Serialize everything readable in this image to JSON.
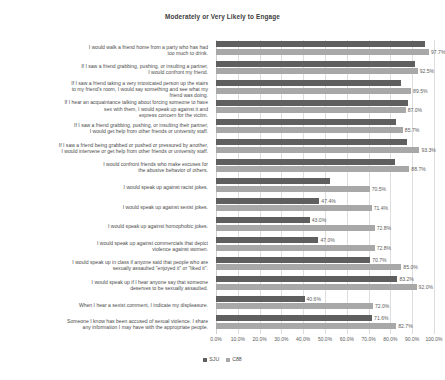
{
  "chart_data": {
    "type": "bar",
    "orientation": "horizontal",
    "title": "Moderately or Very Likely to Engage",
    "xlabel": "",
    "ylabel": "",
    "xlim": [
      0,
      100
    ],
    "grid": true,
    "legend_position": "bottom",
    "tick_labels": [
      "0.0%",
      "10.0%",
      "20.0%",
      "30.0%",
      "40.0%",
      "50.0%",
      "60.0%",
      "70.0%",
      "80.0%",
      "90.0%",
      "100.0%"
    ],
    "tick_values": [
      0,
      10,
      20,
      30,
      40,
      50,
      60,
      70,
      80,
      90,
      100
    ],
    "categories": [
      "I would walk a friend home from a party who has had\ntoo much to drink.",
      "If I saw a friend grabbing, pushing, or insulting a partner,\nI would confront my friend.",
      "If I saw a friend taking a very intoxicated person up the stairs\nto my friend's room, I would say something and see what my\nfriend was doing.",
      "If I hear an acquaintance talking about forcing someone to have\nsex with them, I would speak up against it and\nexpress concern for the victim.",
      "If I saw a friend grabbing, pushing, or insulting their partner,\nI would get help from other friends or university staff.",
      "If I saw a friend being grabbed or pushed or pressured by another,\nI would intervene or get help from other friends or university staff.",
      "I would confront friends who make excuses for\nthe abusive behavior of others.",
      "I would speak up against racist jokes.",
      "I would speak up against sexist jokes.",
      "I would speak up against homophobic jokes.",
      "I would speak up against commercials that depict\nviolence against women.",
      "I would speak up in class if anyone said that people who are\nsexually assaulted \"enjoyed it\" or \"liked it\".",
      "I would speak up if I hear anyone say that someone\ndeserves to be sexually assaulted.",
      "When I hear a sexist comment, I indicate my displeasure.",
      "Someone I know has been accused of sexual violence. I share\nany information I may have with the appropriate people."
    ],
    "series": [
      {
        "name": "SJU",
        "color": "#5f5f5f",
        "values": [
          96.0,
          91.2,
          85.0,
          88.0,
          82.5,
          87.5,
          82.0,
          52.5,
          47.4,
          43.0,
          47.0,
          70.7,
          83.2,
          40.6,
          71.6
        ],
        "labels": [
          "",
          "",
          "",
          "",
          "",
          "",
          "",
          "",
          "47.4%",
          "43.0%",
          "47.0%",
          "70.7%",
          "83.2%",
          "40.6%",
          "71.6%"
        ]
      },
      {
        "name": "C88",
        "color": "#a8a8a8",
        "values": [
          97.7,
          92.5,
          89.5,
          87.0,
          85.7,
          93.3,
          88.7,
          70.5,
          71.4,
          72.8,
          72.8,
          85.0,
          92.0,
          72.0,
          82.7
        ],
        "labels": [
          "97.7%",
          "92.5%",
          "89.5%",
          "87.0%",
          "85.7%",
          "93.3%",
          "88.7%",
          "70.5%",
          "71.4%",
          "72.8%",
          "72.8%",
          "85.0%",
          "92.0%",
          "72.0%",
          "82.7%"
        ]
      }
    ]
  },
  "legend": {
    "items": [
      {
        "label": "SJU",
        "color": "#5f5f5f"
      },
      {
        "label": "C88",
        "color": "#a8a8a8"
      }
    ]
  }
}
